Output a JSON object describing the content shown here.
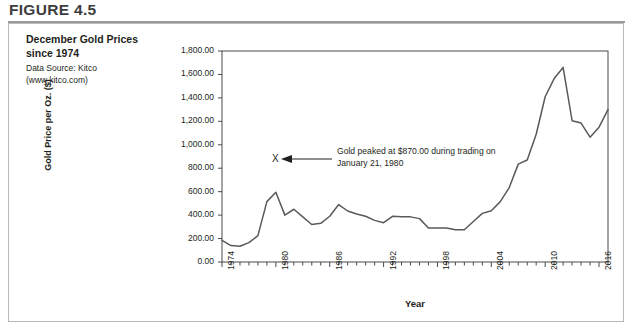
{
  "figure": {
    "header": "FIGURE 4.5",
    "title": "December Gold Prices since 1974",
    "source_line1": "Data Source: Kitco",
    "source_line2": "(www.kitco.com)"
  },
  "annotation": {
    "marker": "X",
    "text": "Gold peaked at $870.00 during trading on January 21, 1980"
  },
  "chart_data": {
    "type": "line",
    "title": "December Gold Prices since 1974",
    "xlabel": "Year",
    "ylabel": "Gold Price per Oz. ($)",
    "xlim": [
      1974,
      2017
    ],
    "ylim": [
      0,
      1800
    ],
    "ytick_labels": [
      "0.00",
      "200.00",
      "400.00",
      "600.00",
      "800.00",
      "1,000.00",
      "1,200.00",
      "1,400.00",
      "1,600.00",
      "1,800.00"
    ],
    "ytick_values": [
      0,
      200,
      400,
      600,
      800,
      1000,
      1200,
      1400,
      1600,
      1800
    ],
    "xtick_labels": [
      "1974",
      "1980",
      "1986",
      "1992",
      "1998",
      "2004",
      "2010",
      "2016"
    ],
    "xtick_values": [
      1974,
      1980,
      1986,
      1992,
      1998,
      2004,
      2010,
      2016
    ],
    "xtick_step_minor": 1,
    "grid": false,
    "legend": null,
    "line_color": "#595959",
    "x": [
      1974,
      1975,
      1976,
      1977,
      1978,
      1979,
      1980,
      1981,
      1982,
      1983,
      1984,
      1985,
      1986,
      1987,
      1988,
      1989,
      1990,
      1991,
      1992,
      1993,
      1994,
      1995,
      1996,
      1997,
      1998,
      1999,
      2000,
      2001,
      2002,
      2003,
      2004,
      2005,
      2006,
      2007,
      2008,
      2009,
      2010,
      2011,
      2012,
      2013,
      2014,
      2015,
      2016,
      2017
    ],
    "values": [
      185,
      140,
      135,
      165,
      225,
      515,
      595,
      400,
      450,
      385,
      320,
      330,
      390,
      490,
      435,
      410,
      390,
      355,
      335,
      390,
      385,
      385,
      370,
      290,
      290,
      290,
      275,
      275,
      345,
      415,
      438,
      515,
      635,
      835,
      870,
      1090,
      1410,
      1565,
      1660,
      1205,
      1185,
      1065,
      1150,
      1300
    ],
    "annotations": [
      {
        "x": 1980,
        "y": 870,
        "marker": "X",
        "text": "Gold peaked at $870.00 during trading on January 21, 1980"
      }
    ]
  }
}
